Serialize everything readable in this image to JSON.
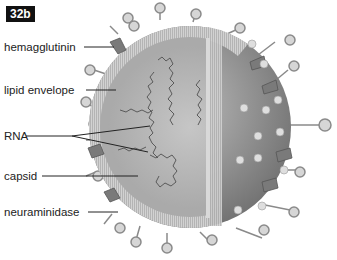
{
  "figure": {
    "badge": "32b"
  },
  "labels": [
    {
      "id": "hemagglutinin",
      "text": "hemagglutinin"
    },
    {
      "id": "lipid-envelope",
      "text": "lipid envelope"
    },
    {
      "id": "rna",
      "text": "RNA"
    },
    {
      "id": "capsid",
      "text": "capsid"
    },
    {
      "id": "neuraminidase",
      "text": "neuraminidase"
    }
  ],
  "colors": {
    "background": "#ffffff",
    "envelope": "#c9c9c9",
    "capsid": "#a9a9a9",
    "interior": "#b8b8b8",
    "outer_surface": "#8f8f8f",
    "spike": "#7a7a7a",
    "label_text": "#222222"
  }
}
